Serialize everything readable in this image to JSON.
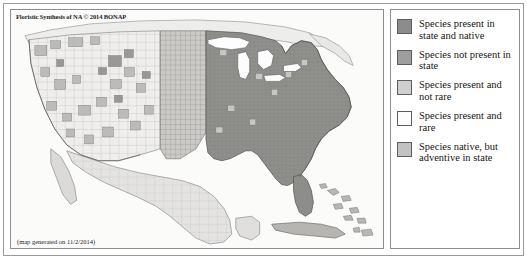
{
  "figure": {
    "map": {
      "title": "Floristic Synthesis of NA © 2014 BONAP",
      "caption": "(map generated on 11/2/2014)",
      "region": "Continental United States, southern Canada, northern Mexico, Cuba and the Bahamas, with county-level subdivisions"
    },
    "legend": {
      "items": [
        {
          "label": "Species present in state and native",
          "color": "#8c8c8c",
          "border": "#5d5d5d"
        },
        {
          "label": "Species not present in state",
          "color": "#9e9e9e",
          "border": "#5d5d5d"
        },
        {
          "label": "Species present and not rare",
          "color": "#cfcfcf",
          "border": "#5d5d5d"
        },
        {
          "label": "Species present and rare",
          "color": "#fdfdfd",
          "border": "#5d5d5d"
        },
        {
          "label": "Species native, but adventive in state",
          "color": "#c2c2c2",
          "border": "#5d5d5d"
        }
      ]
    }
  }
}
